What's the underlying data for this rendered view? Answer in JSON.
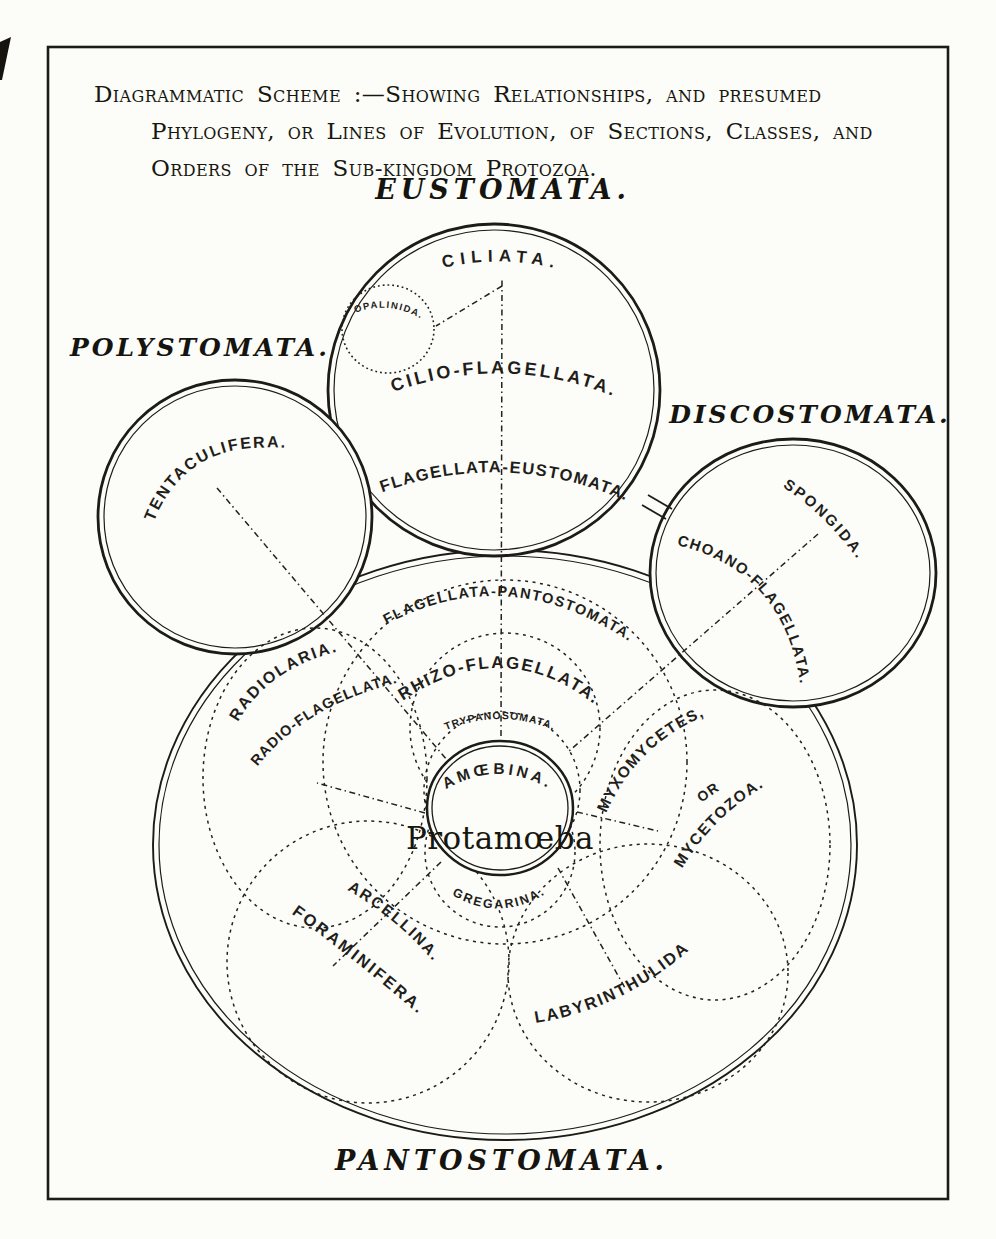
{
  "title": {
    "line1": "Diagrammatic Scheme :—Showing Relationships, and presumed",
    "line2": "Phylogeny, or Lines of Evolution, of Sections, Classes, and",
    "line3": "Orders of the Sub-kingdom Protozoa."
  },
  "sections": {
    "eustomata": "EUSTOMATA.",
    "polystomata": "POLYSTOMATA.",
    "discostomata": "DISCOSTOMATA.",
    "pantostomata": "PANTOSTOMATA."
  },
  "nodes": {
    "ciliata": "CILIATA.",
    "opalinida": "OPALINIDA.",
    "cilio_flagellata": "CILIO-FLAGELLATA.",
    "flagellata_eustomata": "FLAGELLATA-EUSTOMATA.",
    "tentaculifera": "TENTACULIFERA.",
    "spongida": "SPONGIDA.",
    "choano_flagellata": "CHOANO-FLAGELLATA.",
    "flagellata_pantostomata": "FLAGELLATA-PANTOSTOMATA.",
    "rhizo_flagellata": "RHIZO-FLAGELLATA.",
    "trypanosomata": "TRYPANOSOMATA.",
    "amoebina": "AMŒBINA.",
    "protamoeba": "Protamœba",
    "gregarina": "GREGARINA.",
    "radiolaria": "RADIOLARIA.",
    "radio_flagellata": "RADIO-FLAGELLATA.",
    "myxomycetes_line1": "MYXOMYCETES,",
    "myxomycetes_line2": "OR",
    "myxomycetes_line3": "MYCETOZOA.",
    "arcellina": "ARCELLINA.",
    "foraminifera": "FORAMINIFERA.",
    "labyrinthulida": "LABYRINTHULIDA"
  },
  "colors": {
    "ink": "#1f1e1a",
    "paper": "#fcfcf9"
  }
}
